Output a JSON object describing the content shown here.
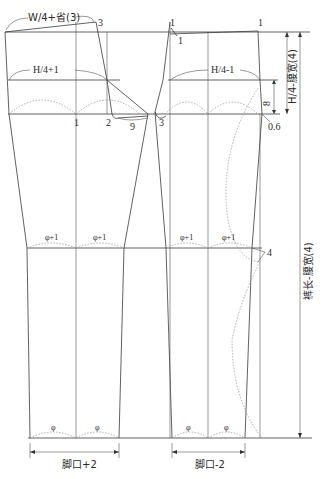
{
  "diagram": {
    "type": "trouser pattern draft",
    "labels": {
      "front_waist": "W/4+省(3)",
      "front_hip": "H/4+1",
      "back_hip": "H/4-1",
      "waist_depth": "H/4-腰宽(4)",
      "leg_length": "裤长-腰宽(4)",
      "front_hem": "脚口+2",
      "back_hem": "脚口-2",
      "dart_3_top": "3",
      "mark_1_front": "1",
      "mark_2": "2",
      "mark_9": "9",
      "mark_3_back": "3",
      "mark_1_back_top_left": "1",
      "mark_1_back_inner": "1",
      "mark_1_back_top_right": "1",
      "mark_8": "8",
      "mark_06": "0.6",
      "mark_4": "4",
      "knee_front_left": "φ+1",
      "knee_front_right": "φ+1",
      "knee_back_left": "φ+1",
      "knee_back_right": "φ+1",
      "hem_front_left": "φ",
      "hem_front_right": "φ",
      "hem_back_left": "φ",
      "hem_back_right": "φ"
    },
    "colors": {
      "line": "#3a3a3a",
      "dotted": "#9a9a9a",
      "text": "#2a2a2a"
    }
  }
}
